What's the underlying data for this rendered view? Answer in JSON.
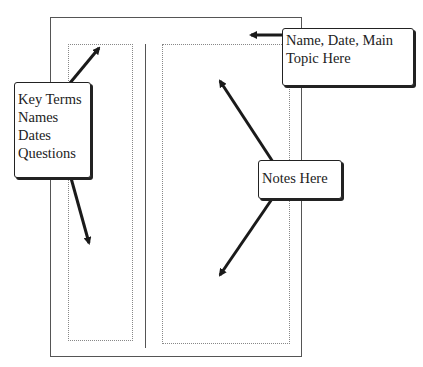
{
  "diagram": {
    "callouts": {
      "key_terms": [
        "Key Terms",
        "Names",
        "Dates",
        "Questions"
      ],
      "header_line1": "Name, Date, Main",
      "header_line2": "Topic Here",
      "notes": "Notes Here"
    },
    "colors": {
      "line": "#555555",
      "dotted": "#888888",
      "text": "#222222",
      "arrow": "#1a1a1a"
    }
  }
}
